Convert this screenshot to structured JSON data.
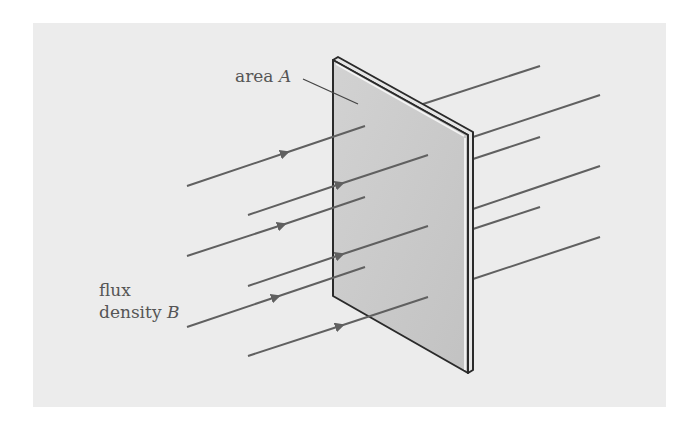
{
  "diagram": {
    "labels": {
      "area": {
        "text": "area ",
        "symbol": "A"
      },
      "flux_line1": "flux",
      "flux_line2": {
        "text": "density ",
        "symbol": "B"
      }
    },
    "colors": {
      "background_panel": "#ececec",
      "plate_face": "#c9c9c9",
      "plate_edge": "#e8e8e8",
      "outline": "#2a2a2a",
      "field_lines": "#606060",
      "text": "#555555"
    },
    "field_line_count": 6
  }
}
